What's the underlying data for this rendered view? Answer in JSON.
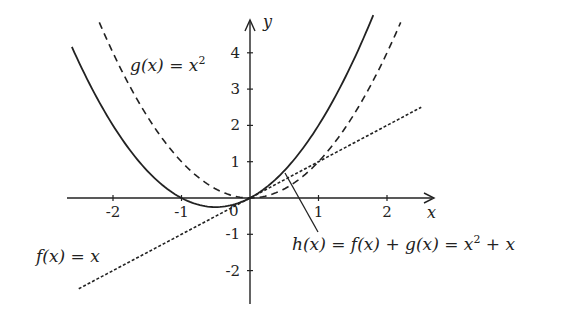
{
  "chart_data": {
    "type": "line",
    "title": "",
    "xlabel": "x",
    "ylabel": "y",
    "xlim": [
      -2.7,
      2.7
    ],
    "ylim": [
      -3,
      5
    ],
    "grid": false,
    "legend": "inline labels",
    "x_ticks": [
      -2,
      -1,
      1,
      2
    ],
    "x_tick_labels": [
      "-2",
      "-1",
      "1",
      "2"
    ],
    "y_ticks": [
      -2,
      -1,
      1,
      2,
      3,
      4
    ],
    "y_tick_labels": [
      "-2",
      "-1",
      "1",
      "2",
      "3",
      "4"
    ],
    "origin_label": "0",
    "series": [
      {
        "name": "f(x) = x",
        "style": "dotted",
        "x_range": [
          -2.5,
          2.5
        ],
        "x": [
          -2.5,
          -2,
          -1,
          0,
          1,
          2,
          2.5
        ],
        "y": [
          -2.5,
          -2,
          -1,
          0,
          1,
          2,
          2.5
        ]
      },
      {
        "name": "g(x) = x^2",
        "style": "dashed",
        "x_range": [
          -2.2,
          2.2
        ],
        "x": [
          -2.2,
          -2,
          -1,
          0,
          1,
          2,
          2.2
        ],
        "y": [
          4.84,
          4,
          1,
          0,
          1,
          4,
          4.84
        ]
      },
      {
        "name": "h(x) = f(x) + g(x) = x^2 + x",
        "style": "solid",
        "x_range": [
          -2.6,
          1.8
        ],
        "x": [
          -2.6,
          -2,
          -1,
          -0.5,
          0,
          1,
          1.8
        ],
        "y": [
          4.16,
          2,
          0,
          -0.25,
          0,
          2,
          5.04
        ]
      }
    ],
    "annotations": [
      {
        "text": "g(x) = x²",
        "near_series": "g(x) = x^2"
      },
      {
        "text": "f(x) = x",
        "near_series": "f(x) = x"
      },
      {
        "text": "h(x) = f(x) + g(x) = x² + x",
        "near_series": "h(x) = f(x) + g(x) = x^2 + x",
        "leader_line": true
      }
    ]
  },
  "labels": {
    "x_axis": "x",
    "y_axis": "y",
    "origin": "0",
    "g_label": "g(x) = x",
    "g_sup": "2",
    "f_label": "f(x) = x",
    "h_label_part1": "h(x) = f(x) + g(x) = x",
    "h_sup": "2",
    "h_label_part2": " + x"
  }
}
